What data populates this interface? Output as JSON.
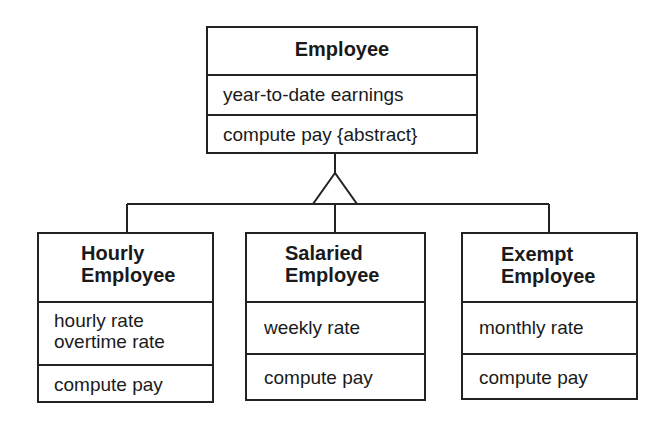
{
  "diagram": {
    "type": "UML class diagram (generalization)",
    "superclass": {
      "name": "Employee",
      "attributes": [
        "year-to-date earnings"
      ],
      "operations": [
        "compute pay {abstract}"
      ]
    },
    "subclasses": [
      {
        "name_line1": "Hourly",
        "name_line2": "Employee",
        "attributes": [
          "hourly rate",
          "overtime rate"
        ],
        "operations": [
          "compute pay"
        ]
      },
      {
        "name_line1": "Salaried",
        "name_line2": "Employee",
        "attributes": [
          "weekly rate"
        ],
        "operations": [
          "compute pay"
        ]
      },
      {
        "name_line1": "Exempt",
        "name_line2": "Employee",
        "attributes": [
          "monthly rate"
        ],
        "operations": [
          "compute pay"
        ]
      }
    ],
    "relationship": "inheritance-triangle",
    "colors": {
      "line": "#222222",
      "background": "#ffffff",
      "text": "#1a1a1a"
    }
  }
}
